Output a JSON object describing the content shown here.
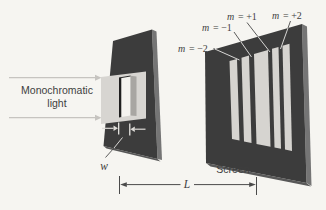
{
  "diagram": {
    "source_label": {
      "line1": "Monochromatic",
      "line2": "light"
    },
    "slit_width_symbol": "w",
    "distance_symbol": "L",
    "screen_label": "Screen",
    "order_labels": [
      {
        "symbol": "m",
        "value": "= −2"
      },
      {
        "symbol": "m",
        "value": "= −1"
      },
      {
        "symbol": "m",
        "value": "= +1"
      },
      {
        "symbol": "m",
        "value": "= +2"
      }
    ]
  },
  "colors": {
    "background": "#f6f5f1",
    "plate": "#3c3c3c",
    "plate_side": "#757575",
    "plate_bottom": "#585858",
    "beam": "#d7d5d1",
    "fringe": "#d6d4d0",
    "slit_white": "#f4f3ef",
    "slit_shadow": "#1f1f1f",
    "slit_wall": "#a8a6a2",
    "arrow": "#c6c4c0",
    "arrow_light": "#dcdad6",
    "leader_dark": "#4a4a4a",
    "leader_light": "#e9e8e5",
    "text": "#3e3e3e"
  }
}
